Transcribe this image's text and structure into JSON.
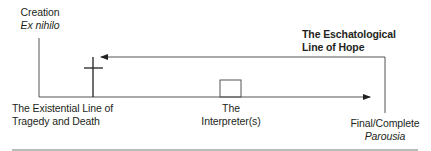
{
  "diagram": {
    "creation": {
      "title": "Creation",
      "subtitle": "Ex nihilo"
    },
    "eschatological": {
      "line1": "The Eschatological",
      "line2": "Line of Hope"
    },
    "existential": {
      "line1": "The Existential Line of",
      "line2": "Tragedy and Death"
    },
    "interpreter": {
      "line1": "The",
      "line2": "Interpreter(s)"
    },
    "final": {
      "line1": "Final/Complete",
      "line2": "Parousia"
    },
    "colors": {
      "line": "#4a4a4a",
      "text": "#231f20"
    }
  }
}
